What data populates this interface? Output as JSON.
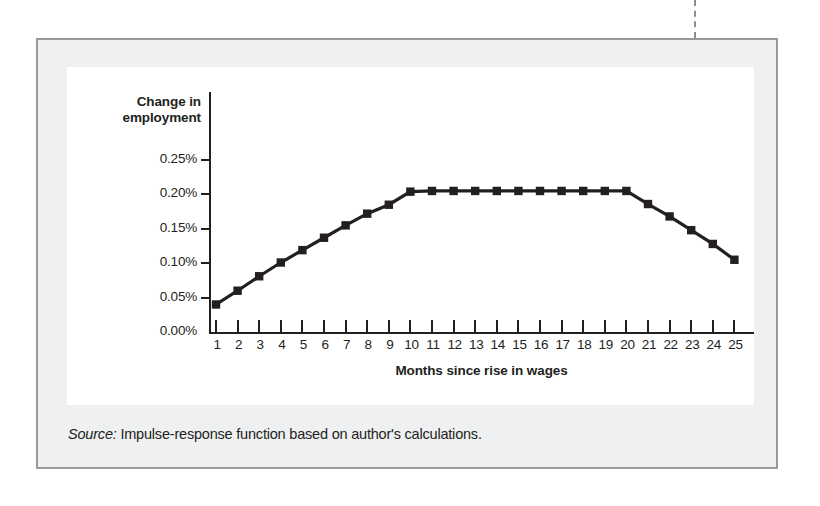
{
  "figure": {
    "source_label": "Source:",
    "source_text": " Impulse-response function based on author's calculations."
  },
  "chart_data": {
    "type": "line",
    "title": "",
    "xlabel": "Months since rise in wages",
    "ylabel": "Change in employment",
    "ylabel_line1": "Change in",
    "ylabel_line2": "employment",
    "x": [
      1,
      2,
      3,
      4,
      5,
      6,
      7,
      8,
      9,
      10,
      11,
      12,
      13,
      14,
      15,
      16,
      17,
      18,
      19,
      20,
      21,
      22,
      23,
      24,
      25
    ],
    "values": [
      0.04,
      0.06,
      0.081,
      0.101,
      0.119,
      0.137,
      0.155,
      0.172,
      0.185,
      0.204,
      0.205,
      0.205,
      0.205,
      0.205,
      0.205,
      0.205,
      0.205,
      0.205,
      0.205,
      0.205,
      0.186,
      0.168,
      0.148,
      0.128,
      0.105
    ],
    "x_tick_labels": [
      "1",
      "2",
      "3",
      "4",
      "5",
      "6",
      "7",
      "8",
      "9",
      "10",
      "11",
      "12",
      "13",
      "14",
      "15",
      "16",
      "17",
      "18",
      "19",
      "20",
      "21",
      "22",
      "23",
      "24",
      "25"
    ],
    "y_tick_labels": [
      "0.25%",
      "0.20%",
      "0.15%",
      "0.10%",
      "0.05%",
      "0.00%"
    ],
    "y_tick_values": [
      0.25,
      0.2,
      0.15,
      0.1,
      0.05,
      0.0
    ],
    "xlim": [
      0.5,
      25.6
    ],
    "ylim": [
      0.0,
      0.25
    ],
    "grid": false,
    "legend": "none",
    "series_color": "#231f20",
    "marker": "square",
    "unit": "%"
  }
}
